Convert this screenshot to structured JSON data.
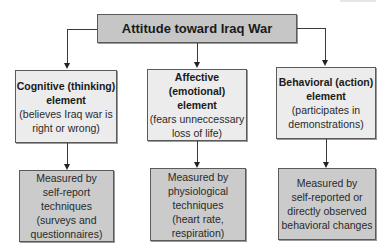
{
  "diagram": {
    "root": {
      "label": "Attitude toward Iraq War"
    },
    "elements": [
      {
        "heading_line1": "Cognitive (thinking)",
        "heading_line2": "element",
        "desc_line1": "(believes Iraq war is",
        "desc_line2": "right or wrong)",
        "measure_lines": [
          "Measured by",
          "self-report",
          "techniques",
          "(surveys and",
          "questionnaires)"
        ]
      },
      {
        "heading_line1": "Affective (emotional)",
        "heading_line2": "element",
        "desc_line1": "(fears unneccessary",
        "desc_line2": "loss of life)",
        "measure_lines": [
          "Measured by",
          "physiological",
          "techniques",
          "(heart rate,",
          "respiration)"
        ]
      },
      {
        "heading_line1": "Behavioral (action)",
        "heading_line2": "element",
        "desc_line1": "(participates in",
        "desc_line2": "demonstrations)",
        "measure_lines": [
          "Measured by",
          "self-reported or",
          "directly observed",
          "behavioral changes"
        ]
      }
    ],
    "colors": {
      "root_fill": "#c6c6c6",
      "element_fill": "#ececec",
      "measure_fill": "#cbcbcb",
      "border": "#5a5a5a"
    }
  }
}
